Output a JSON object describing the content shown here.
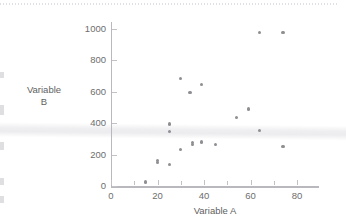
{
  "chart_data": {
    "type": "scatter",
    "title": "",
    "xlabel": "Variable A",
    "ylabel": "Variable B",
    "xlim": [
      0,
      85
    ],
    "ylim": [
      0,
      1050
    ],
    "xticks": [
      0,
      20,
      40,
      60,
      80
    ],
    "yticks": [
      0,
      200,
      400,
      600,
      800,
      1000
    ],
    "grid": false,
    "legend": null,
    "marker_color": "#8e8e93",
    "axis_color": "#b9b9bd",
    "points": [
      {
        "x": 15,
        "y": 25
      },
      {
        "x": 20,
        "y": 165
      },
      {
        "x": 20,
        "y": 150
      },
      {
        "x": 25,
        "y": 135
      },
      {
        "x": 25,
        "y": 395
      },
      {
        "x": 25,
        "y": 348
      },
      {
        "x": 30,
        "y": 232
      },
      {
        "x": 30,
        "y": 685
      },
      {
        "x": 34,
        "y": 595
      },
      {
        "x": 35,
        "y": 275
      },
      {
        "x": 35,
        "y": 262
      },
      {
        "x": 39,
        "y": 648
      },
      {
        "x": 39,
        "y": 280
      },
      {
        "x": 45,
        "y": 262
      },
      {
        "x": 54,
        "y": 438
      },
      {
        "x": 59,
        "y": 490
      },
      {
        "x": 64,
        "y": 980
      },
      {
        "x": 64,
        "y": 352
      },
      {
        "x": 74,
        "y": 978
      },
      {
        "x": 74,
        "y": 252
      }
    ]
  },
  "axes": {
    "x_title": "Variable A",
    "y_title_line1": "Variable",
    "y_title_line2": "B",
    "x_tick_labels": [
      "0",
      "20",
      "40",
      "60",
      "80"
    ],
    "y_tick_labels": [
      "0",
      "200",
      "400",
      "600",
      "800",
      "1000"
    ]
  }
}
